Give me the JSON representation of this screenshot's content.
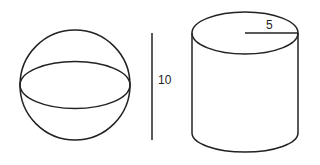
{
  "diagram": {
    "shapes": [
      {
        "name": "sphere"
      },
      {
        "name": "cylinder"
      }
    ],
    "labels": {
      "height": "10",
      "radius": "5"
    },
    "stroke_color": "#222222",
    "background": "#ffffff"
  }
}
